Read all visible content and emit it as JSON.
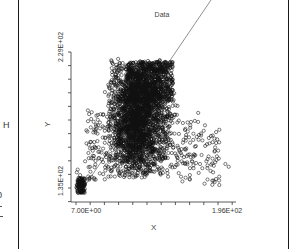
{
  "side_panel": {
    "letter": "H",
    "partial_glyph": "0"
  },
  "chart_data": {
    "type": "scatter",
    "title": "Data",
    "xlabel": "X",
    "ylabel": "Y",
    "x_ticks": [
      "7.00E+00",
      "1.96E+02"
    ],
    "y_ticks": [
      "1.35E+02",
      "2.29E+02"
    ],
    "xlim": [
      7.0,
      196.0
    ],
    "ylim": [
      135.0,
      229.0
    ],
    "grid": false,
    "legend": null,
    "marker": "open-circle",
    "reference_line": {
      "description": "diagonal line from lower-left cluster to upper right beyond plot",
      "from": [
        7.0,
        135.0
      ],
      "to": [
        250.0,
        320.0
      ]
    },
    "clusters": [
      {
        "name": "main-dense-cluster",
        "x_range": [
          55,
          125
        ],
        "y_range": [
          140,
          222
        ],
        "density": "very high"
      },
      {
        "name": "lower-left-cluster",
        "x_range": [
          7,
          14
        ],
        "y_range": [
          129,
          146
        ],
        "density": "high"
      },
      {
        "name": "right-tail",
        "x_range": [
          120,
          190
        ],
        "y_range": [
          133,
          190
        ],
        "density": "sparse"
      }
    ],
    "series": [
      {
        "name": "Data",
        "points_sample": [
          [
            7.5,
            131
          ],
          [
            8,
            133
          ],
          [
            9,
            135
          ],
          [
            10,
            138
          ],
          [
            8,
            142
          ],
          [
            9,
            144
          ],
          [
            12,
            140
          ],
          [
            15,
            138
          ],
          [
            18,
            150
          ],
          [
            22,
            156
          ],
          [
            24,
            146
          ],
          [
            28,
            152
          ],
          [
            30,
            160
          ],
          [
            33,
            170
          ],
          [
            36,
            178
          ],
          [
            40,
            184
          ],
          [
            42,
            200
          ],
          [
            46,
            190
          ],
          [
            50,
            176
          ],
          [
            55,
            210
          ],
          [
            58,
            224
          ],
          [
            60,
            192
          ],
          [
            62,
            170
          ],
          [
            64,
            150
          ],
          [
            68,
            200
          ],
          [
            70,
            160
          ],
          [
            75,
            215
          ],
          [
            80,
            185
          ],
          [
            85,
            145
          ],
          [
            90,
            222
          ],
          [
            95,
            165
          ],
          [
            100,
            205
          ],
          [
            105,
            180
          ],
          [
            110,
            150
          ],
          [
            115,
            200
          ],
          [
            120,
            175
          ],
          [
            125,
            160
          ],
          [
            130,
            190
          ],
          [
            135,
            150
          ],
          [
            140,
            165
          ],
          [
            145,
            140
          ],
          [
            150,
            155
          ],
          [
            155,
            185
          ],
          [
            160,
            145
          ],
          [
            165,
            150
          ],
          [
            170,
            143
          ],
          [
            175,
            135
          ],
          [
            180,
            152
          ],
          [
            188,
            148
          ],
          [
            192,
            146
          ]
        ]
      }
    ]
  }
}
